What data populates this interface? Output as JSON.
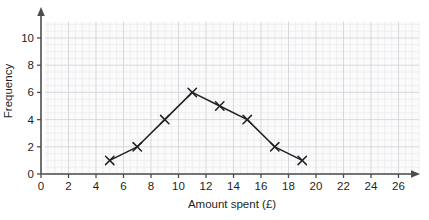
{
  "chart_data": {
    "type": "line",
    "title": "",
    "xlabel": "Amount spent (£)",
    "ylabel": "Frequency",
    "x": [
      5,
      7,
      9,
      11,
      13,
      15,
      17,
      19
    ],
    "values": [
      1,
      2,
      4,
      6,
      5,
      4,
      2,
      1
    ],
    "series": [
      {
        "name": "Frequency",
        "x": [
          5,
          7,
          9,
          11,
          13,
          15,
          17,
          19
        ],
        "values": [
          1,
          2,
          4,
          6,
          5,
          4,
          2,
          1
        ]
      }
    ],
    "points": [
      {
        "x": 5,
        "y": 1
      },
      {
        "x": 7,
        "y": 2
      },
      {
        "x": 9,
        "y": 4
      },
      {
        "x": 11,
        "y": 6
      },
      {
        "x": 13,
        "y": 5
      },
      {
        "x": 15,
        "y": 4
      },
      {
        "x": 17,
        "y": 2
      },
      {
        "x": 19,
        "y": 1
      }
    ],
    "xlim": [
      0,
      27.5
    ],
    "ylim": [
      0,
      11.2
    ],
    "xticks": [
      0,
      2,
      4,
      6,
      8,
      10,
      12,
      14,
      16,
      18,
      20,
      22,
      24,
      26
    ],
    "xtick_labels": [
      "0",
      "2",
      "4",
      "6",
      "8",
      "10",
      "12",
      "14",
      "16",
      "18",
      "20",
      "22",
      "24",
      "26"
    ],
    "yticks": [
      0,
      2,
      4,
      6,
      8,
      10
    ],
    "ytick_labels": [
      "0",
      "2",
      "4",
      "6",
      "8",
      "10"
    ],
    "grid": true,
    "grid_minor_step": 0.5,
    "grid_major_step": 2,
    "legend": false,
    "legend_position": "none",
    "marker": "x",
    "line_color": "#231f20",
    "marker_color": "#231f20",
    "grid_minor_color": "#e9eaec",
    "grid_major_color": "#d3d5d8",
    "axis_color": "#4d4d4f",
    "text_color": "#231f20",
    "background_color": "#ffffff",
    "plot_background_color": "#fbfbfc"
  }
}
